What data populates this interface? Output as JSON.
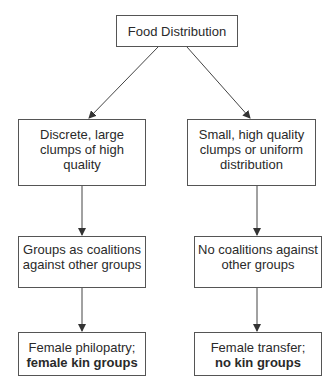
{
  "diagram": {
    "type": "flowchart",
    "root": {
      "id": "food-distribution",
      "lines": [
        "Food Distribution"
      ]
    },
    "branches": [
      {
        "side": "left",
        "nodes": [
          {
            "id": "discrete-large-clumps",
            "lines": [
              "Discrete, large",
              "clumps of high",
              "quality"
            ]
          },
          {
            "id": "groups-as-coalitions",
            "lines": [
              "Groups as coalitions",
              "against other groups"
            ]
          },
          {
            "id": "female-philopatry",
            "lines": [
              "Female philopatry;",
              "female kin groups"
            ],
            "bold_line_index": 1
          }
        ]
      },
      {
        "side": "right",
        "nodes": [
          {
            "id": "small-high-quality-clumps",
            "lines": [
              "Small, high quality",
              "clumps or uniform",
              "distribution"
            ]
          },
          {
            "id": "no-coalitions",
            "lines": [
              "No coalitions against",
              "other groups"
            ]
          },
          {
            "id": "female-transfer",
            "lines": [
              "Female transfer;",
              "no kin groups"
            ],
            "bold_line_index": 1
          }
        ]
      }
    ],
    "edges": [
      {
        "from": "food-distribution",
        "to": "discrete-large-clumps"
      },
      {
        "from": "food-distribution",
        "to": "small-high-quality-clumps"
      },
      {
        "from": "discrete-large-clumps",
        "to": "groups-as-coalitions"
      },
      {
        "from": "groups-as-coalitions",
        "to": "female-philopatry"
      },
      {
        "from": "small-high-quality-clumps",
        "to": "no-coalitions"
      },
      {
        "from": "no-coalitions",
        "to": "female-transfer"
      }
    ],
    "colors": {
      "line": "#444444",
      "border": "#555555",
      "text": "#2a2a2a",
      "background": "#ffffff"
    }
  }
}
